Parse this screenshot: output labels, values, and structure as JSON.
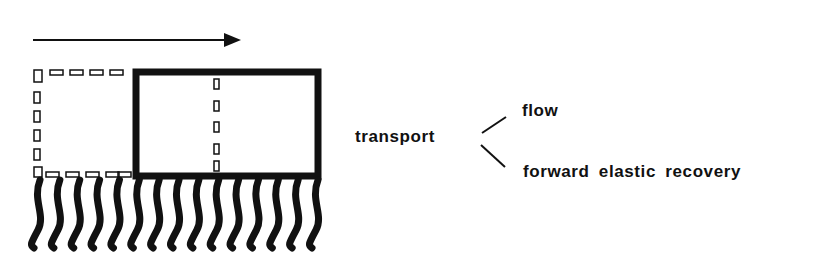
{
  "diagram": {
    "direction_arrow": "right",
    "fiber_count": 15,
    "labels": {
      "transport": "transport",
      "branches": [
        "flow",
        "forward elastic recovery"
      ]
    },
    "colors": {
      "ink": "#111111",
      "background": "#ffffff"
    }
  }
}
